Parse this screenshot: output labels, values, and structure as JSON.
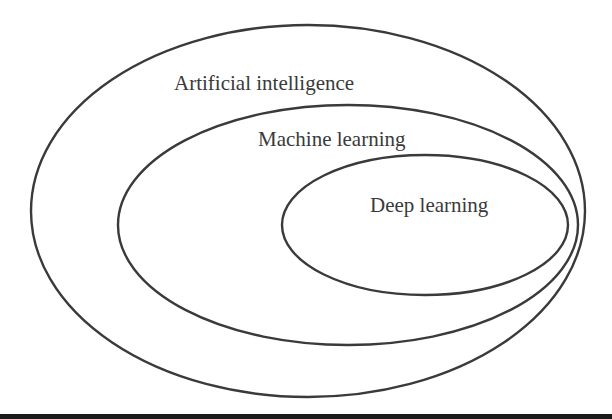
{
  "diagram": {
    "type": "nested-ellipses",
    "colors": {
      "stroke": "#3a3a3a",
      "text": "#3a3a3a",
      "background": "#ffffff",
      "bottom_bar": "#1a1a1a"
    },
    "sets": [
      {
        "id": "ai",
        "label": "Artificial intelligence",
        "cx": 308,
        "cy": 211,
        "rx": 277,
        "ry": 186,
        "label_x": 174,
        "label_y": 90
      },
      {
        "id": "ml",
        "label": "Machine learning",
        "cx": 348,
        "cy": 225,
        "rx": 230,
        "ry": 120,
        "label_x": 258,
        "label_y": 146
      },
      {
        "id": "dl",
        "label": "Deep learning",
        "cx": 425,
        "cy": 225,
        "rx": 143,
        "ry": 70,
        "label_x": 370,
        "label_y": 212
      }
    ]
  }
}
